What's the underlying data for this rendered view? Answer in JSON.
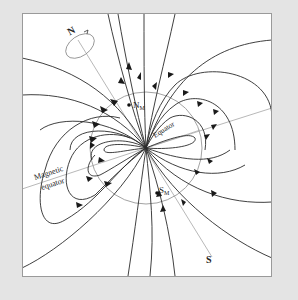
{
  "figure": {
    "labels": {
      "geographic_north": "N",
      "geographic_south": "S",
      "magnetic_north": "N",
      "magnetic_north_sub": "M",
      "magnetic_south": "S",
      "magnetic_south_sub": "M",
      "equator": "Equator",
      "magnetic_equator_line1": "Magnetic",
      "magnetic_equator_line2": "equator"
    },
    "colors": {
      "background": "#e4e4e4",
      "panel": "#ffffff",
      "field_lines": "#2a2a2a",
      "earth_outline": "#8a8a8a",
      "axis_lines": "#9a9a9a"
    }
  }
}
